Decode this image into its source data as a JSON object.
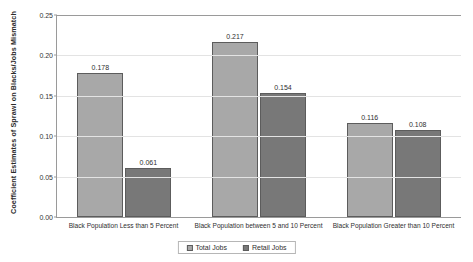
{
  "chart_data": {
    "type": "bar",
    "title": "",
    "xlabel": "",
    "ylabel": "Coefficient Estimates of Sprawl on Blacks/Jobs Mismatch",
    "ylim": [
      0.0,
      0.25
    ],
    "yticks": [
      "0.00",
      "0.05",
      "0.10",
      "0.15",
      "0.20",
      "0.25"
    ],
    "ytick_values": [
      0.0,
      0.05,
      0.1,
      0.15,
      0.2,
      0.25
    ],
    "grid": true,
    "legend_position": "bottom-center",
    "categories": [
      "Black Population Less than 5 Percent",
      "Black Population between 5 and 10 Percent",
      "Black Population Greater than 10 Percent"
    ],
    "series": [
      {
        "name": "Total Jobs",
        "color": "#a8a8a8",
        "values": [
          0.178,
          0.154,
          0.116
        ],
        "labels": [
          "0.178",
          "0.217",
          "0.116"
        ]
      },
      {
        "name": "Retail Jobs",
        "color": "#787878",
        "values": [
          0.061,
          0.154,
          0.108
        ],
        "labels": [
          "0.061",
          "0.154",
          "0.108"
        ]
      }
    ],
    "bars": [
      {
        "category_index": 0,
        "series": "Total Jobs",
        "value": 0.178,
        "label": "0.178"
      },
      {
        "category_index": 0,
        "series": "Retail Jobs",
        "value": 0.061,
        "label": "0.061"
      },
      {
        "category_index": 1,
        "series": "Total Jobs",
        "value": 0.217,
        "label": "0.217"
      },
      {
        "category_index": 1,
        "series": "Retail Jobs",
        "value": 0.154,
        "label": "0.154"
      },
      {
        "category_index": 2,
        "series": "Total Jobs",
        "value": 0.116,
        "label": "0.116"
      },
      {
        "category_index": 2,
        "series": "Retail Jobs",
        "value": 0.108,
        "label": "0.108"
      }
    ]
  }
}
